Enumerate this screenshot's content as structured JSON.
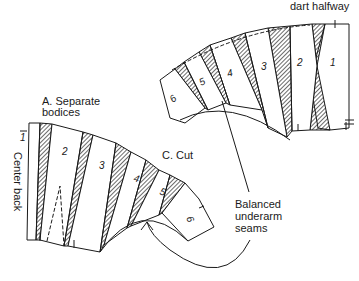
{
  "diagram": {
    "labels": {
      "top_caption": "dart halfway",
      "a_label_line1": "A. Separate",
      "a_label_line2": "bodices",
      "center_back": "Center back",
      "c_label": "C. Cut",
      "seams_line1": "Balanced",
      "seams_line2": "underarm",
      "seams_line3": "seams"
    },
    "left_fan": {
      "pieces": [
        "1",
        "2",
        "3",
        "4",
        "5",
        "6"
      ]
    },
    "right_fan": {
      "pieces": [
        "1",
        "2",
        "3",
        "4",
        "5",
        "6"
      ]
    },
    "colors": {
      "line": "#1a1a1a",
      "background": "#ffffff"
    }
  }
}
